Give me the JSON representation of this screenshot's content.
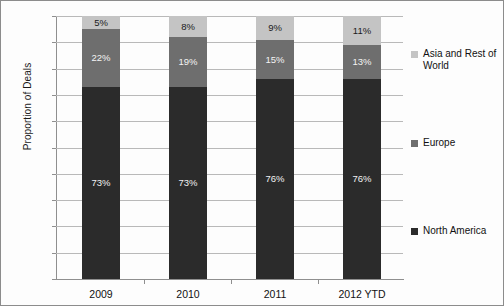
{
  "chart_data": {
    "type": "bar",
    "subtype": "stacked-100-percent",
    "title": "",
    "xlabel": "",
    "ylabel": "Proportion of Deals",
    "ylim": [
      0,
      100
    ],
    "y_unit": "%",
    "grid": true,
    "legend_position": "right",
    "categories": [
      "2009",
      "2010",
      "2011",
      "2012 YTD"
    ],
    "y_ticks": [
      "0%",
      "10%",
      "20%",
      "30%",
      "40%",
      "50%",
      "60%",
      "70%",
      "80%",
      "90%",
      "100%"
    ],
    "y_tick_values": [
      0,
      10,
      20,
      30,
      40,
      50,
      60,
      70,
      80,
      90,
      100
    ],
    "series": [
      {
        "name": "North America",
        "color": "#2b2b2b",
        "values": [
          73,
          73,
          76,
          76
        ],
        "labels": [
          "73%",
          "73%",
          "76%",
          "76%"
        ]
      },
      {
        "name": "Europe",
        "color": "#6e6e6e",
        "values": [
          22,
          19,
          15,
          13
        ],
        "labels": [
          "22%",
          "19%",
          "15%",
          "13%"
        ]
      },
      {
        "name": "Asia and Rest of World",
        "color": "#c4c4c4",
        "values": [
          5,
          8,
          9,
          11
        ],
        "labels": [
          "5%",
          "8%",
          "9%",
          "11%"
        ]
      }
    ]
  },
  "legend": {
    "items": [
      {
        "label": "Asia and Rest of World",
        "color": "#c4c4c4"
      },
      {
        "label": "Europe",
        "color": "#6e6e6e"
      },
      {
        "label": "North America",
        "color": "#2b2b2b"
      }
    ]
  }
}
